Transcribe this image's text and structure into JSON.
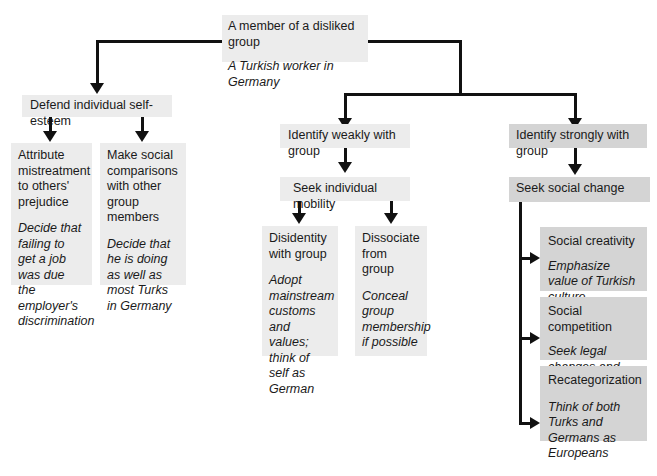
{
  "diagram": {
    "root": {
      "title": "A member of a disliked group",
      "example": "A Turkish worker in Germany"
    },
    "left": {
      "title": "Defend individual self-esteem",
      "children": [
        {
          "title": "Attribute mistreatment to others' prejudice",
          "example": "Decide that failing to get a job was due the employer's discrimination"
        },
        {
          "title": "Make social comparisons with other group members",
          "example": "Decide that he is doing as well as most Turks in Germany"
        }
      ]
    },
    "middle": {
      "title": "Identify weakly with group",
      "strategy": "Seek individual mobility",
      "children": [
        {
          "title": "Disidentity with group",
          "example": "Adopt mainstream customs and values; think of self as German"
        },
        {
          "title": "Dissociate from group",
          "example": "Conceal group membership if possible"
        }
      ]
    },
    "right": {
      "title": "Identify strongly with group",
      "strategy": "Seek social change",
      "children": [
        {
          "title": "Social creativity",
          "example": "Emphasize value of Turkish culture"
        },
        {
          "title": "Social competition",
          "example": "Seek legal changes and protection for Turks' rights"
        },
        {
          "title": "Recategorization",
          "example": "Think of both Turks and Germans as Europeans"
        }
      ]
    },
    "colors": {
      "light_box": "#ececec",
      "dark_box": "#d4d4d4",
      "lines": "#111111"
    }
  }
}
